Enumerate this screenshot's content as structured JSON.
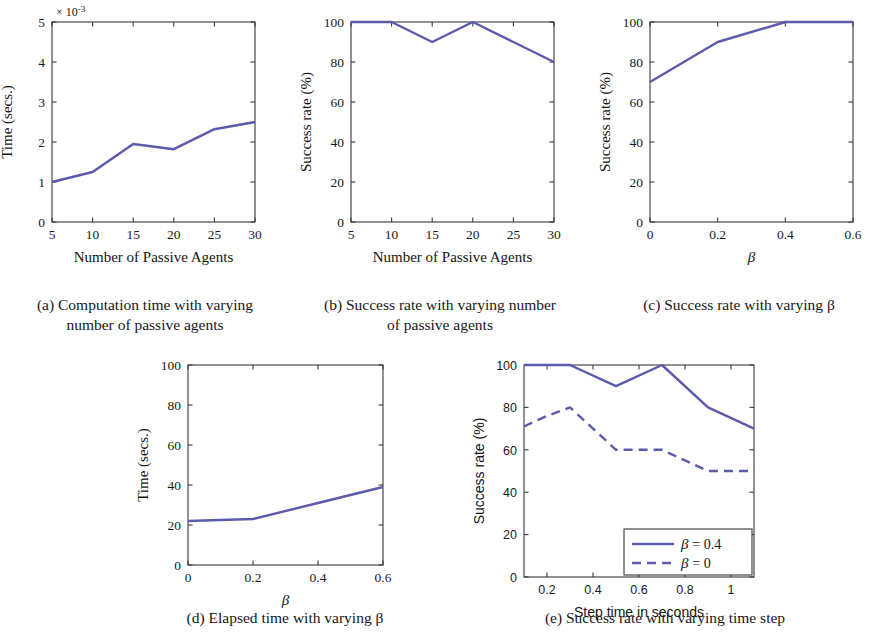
{
  "figure": {
    "background": "#ffffff",
    "line_color": "#5b5bab",
    "axis_color": "#3a3a3a"
  },
  "chart_data": [
    {
      "id": "a",
      "type": "line",
      "title": "",
      "caption": "(a) Computation time with varying number of passive agents",
      "caption_lines": [
        "(a) Computation time with varying",
        "number of passive agents"
      ],
      "xlabel": "Number of Passive Agents",
      "ylabel": "Time (secs.)",
      "exponent_label": "× 10",
      "exponent_power": "-3",
      "x": [
        5,
        10,
        15,
        20,
        25,
        30
      ],
      "values": [
        1.0,
        1.25,
        1.95,
        1.82,
        2.32,
        2.5
      ],
      "xlim": [
        5,
        30
      ],
      "ylim": [
        0,
        5
      ],
      "xticks": [
        5,
        10,
        15,
        20,
        25,
        30
      ],
      "xticklabels": [
        "5",
        "10",
        "15",
        "20",
        "25",
        "30"
      ],
      "yticks": [
        0,
        1,
        2,
        3,
        4,
        5
      ],
      "yticklabels": [
        "0",
        "1",
        "2",
        "3",
        "4",
        "5"
      ],
      "grid": false,
      "legend": null
    },
    {
      "id": "b",
      "type": "line",
      "title": "",
      "caption": "(b) Success rate with varying number of passive agents",
      "caption_lines": [
        "(b) Success rate with varying number",
        "of passive agents"
      ],
      "xlabel": "Number of Passive Agents",
      "ylabel": "Success rate (%)",
      "exponent_label": "",
      "exponent_power": "",
      "x": [
        5,
        10,
        15,
        20,
        25,
        30
      ],
      "values": [
        100,
        100,
        90,
        100,
        90,
        80
      ],
      "xlim": [
        5,
        30
      ],
      "ylim": [
        0,
        100
      ],
      "xticks": [
        5,
        10,
        15,
        20,
        25,
        30
      ],
      "xticklabels": [
        "5",
        "10",
        "15",
        "20",
        "25",
        "30"
      ],
      "yticks": [
        0,
        20,
        40,
        60,
        80,
        100
      ],
      "yticklabels": [
        "0",
        "20",
        "40",
        "60",
        "80",
        "100"
      ],
      "grid": false,
      "legend": null
    },
    {
      "id": "c",
      "type": "line",
      "title": "",
      "caption": "(c) Success rate with varying β",
      "caption_lines": [
        "(c) Success rate with varying β"
      ],
      "xlabel": "β",
      "ylabel": "Success rate (%)",
      "exponent_label": "",
      "exponent_power": "",
      "x": [
        0,
        0.2,
        0.4,
        0.6
      ],
      "values": [
        70,
        90,
        100,
        100
      ],
      "xlim": [
        0,
        0.6
      ],
      "ylim": [
        0,
        100
      ],
      "xticks": [
        0,
        0.2,
        0.4,
        0.6
      ],
      "xticklabels": [
        "0",
        "0.2",
        "0.4",
        "0.6"
      ],
      "yticks": [
        0,
        20,
        40,
        60,
        80,
        100
      ],
      "yticklabels": [
        "0",
        "20",
        "40",
        "60",
        "80",
        "100"
      ],
      "grid": false,
      "legend": null
    },
    {
      "id": "d",
      "type": "line",
      "title": "",
      "caption": "(d) Elapsed time with varying β",
      "caption_lines": [
        "(d) Elapsed time with varying β"
      ],
      "xlabel": "β",
      "ylabel": "Time (secs.)",
      "exponent_label": "",
      "exponent_power": "",
      "x": [
        0,
        0.2,
        0.4,
        0.6
      ],
      "values": [
        22,
        23,
        31,
        39
      ],
      "xlim": [
        0,
        0.6
      ],
      "ylim": [
        0,
        100
      ],
      "xticks": [
        0,
        0.2,
        0.4,
        0.6
      ],
      "xticklabels": [
        "0",
        "0.2",
        "0.4",
        "0.6"
      ],
      "yticks": [
        0,
        20,
        40,
        60,
        80,
        100
      ],
      "yticklabels": [
        "0",
        "20",
        "40",
        "60",
        "80",
        "100"
      ],
      "grid": false,
      "legend": null
    },
    {
      "id": "e",
      "type": "line",
      "title": "",
      "caption": "(e) Success rate with varying time step",
      "caption_lines": [
        "(e) Success rate with varying time step"
      ],
      "xlabel": "Step time in seconds",
      "ylabel": "Success rate (%)",
      "exponent_label": "",
      "exponent_power": "",
      "x": [
        0.1,
        0.2,
        0.3,
        0.5,
        0.7,
        0.9,
        1.1
      ],
      "series": [
        {
          "name": "β = 0.4",
          "style": "solid",
          "x": [
            0.1,
            0.2,
            0.3,
            0.5,
            0.7,
            0.9,
            1.1
          ],
          "values": [
            100,
            100,
            100,
            90,
            100,
            80,
            70
          ]
        },
        {
          "name": "β = 0",
          "style": "dashed",
          "x": [
            0.1,
            0.2,
            0.3,
            0.5,
            0.6,
            0.7,
            0.9,
            1.0,
            1.1
          ],
          "values": [
            71,
            76,
            80,
            60,
            60,
            60,
            50,
            50,
            50
          ]
        }
      ],
      "xlim": [
        0.1,
        1.1
      ],
      "ylim": [
        0,
        100
      ],
      "xticks": [
        0.2,
        0.4,
        0.6,
        0.8,
        1.0
      ],
      "xticklabels": [
        "0.2",
        "0.4",
        "0.6",
        "0.8",
        "1"
      ],
      "yticks": [
        0,
        20,
        40,
        60,
        80,
        100
      ],
      "yticklabels": [
        "0",
        "20",
        "40",
        "60",
        "80",
        "100"
      ],
      "grid": false,
      "legend": {
        "position": "bottom-right",
        "entries": [
          "β = 0.4",
          "β = 0"
        ]
      }
    }
  ]
}
